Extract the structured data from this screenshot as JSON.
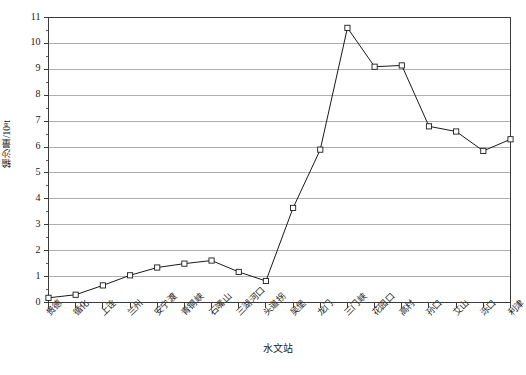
{
  "chart_data": {
    "type": "line",
    "title": "",
    "xlabel": "水文站",
    "ylabel": "输沙量/10⁸t",
    "ylim": [
      0,
      11
    ],
    "ytick_step": 1,
    "yminor_step": 0.5,
    "grid": true,
    "legend": null,
    "marker": "open-square",
    "line_color": "#1a1a1a",
    "grid_color": "#9a9a9a",
    "axis_color": "#4a4a4a",
    "categories": [
      "贵德",
      "循化",
      "上诠",
      "兰州",
      "安宁渡",
      "青铜峡",
      "石嘴山",
      "三湖河口",
      "头道拐",
      "吴堡",
      "龙门",
      "三门峡",
      "花园口",
      "高村",
      "孙口",
      "艾山",
      "泺口",
      "利津"
    ],
    "ytick_labels": [
      "0",
      "1",
      "2",
      "3",
      "4",
      "5",
      "6",
      "7",
      "8",
      "9",
      "10",
      "11"
    ],
    "series": [
      {
        "name": "输沙量",
        "values": [
          0.18,
          0.3,
          0.66,
          1.05,
          1.35,
          1.5,
          1.62,
          1.18,
          0.83,
          3.65,
          5.9,
          10.6,
          9.1,
          9.15,
          6.8,
          6.6,
          5.85,
          6.3
        ]
      }
    ]
  },
  "figure": {
    "caption": ""
  }
}
